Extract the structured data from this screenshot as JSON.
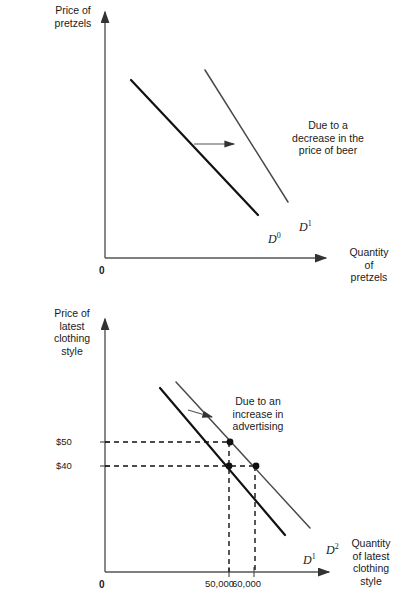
{
  "figures": [
    {
      "id": "demand-shift-pretzels",
      "y_axis_label": "Price of\npretzels",
      "x_axis_label": "Quantity\nof\npretzels",
      "origin_label": "0",
      "annotation": "Due to a\ndecrease in the\nprice of beer",
      "curves": [
        {
          "name": "D0",
          "label": "D",
          "superscript": "0"
        },
        {
          "name": "D1",
          "label": "D",
          "superscript": "1"
        }
      ],
      "shift_arrow": "rightward-shift-arrow",
      "chart_data": {
        "type": "line",
        "title": "",
        "xlabel": "Quantity of pretzels",
        "ylabel": "Price of pretzels",
        "grid": false,
        "legend": "none",
        "annotations": [
          "Due to a decrease in the price of beer"
        ],
        "series": [
          {
            "name": "D0",
            "points": [
              [
                131,
                80
              ],
              [
                258,
                215
              ]
            ]
          },
          {
            "name": "D1",
            "points": [
              [
                205,
                70
              ],
              [
                288,
                202
              ]
            ]
          }
        ],
        "axis_ranges": {
          "x": [
            105,
            332
          ],
          "y": [
            5,
            258
          ]
        }
      }
    },
    {
      "id": "demand-shift-clothing",
      "y_axis_label": "Price of\nlatest\nclothing\nstyle",
      "x_axis_label": "Quantity\nof latest\nclothing\nstyle",
      "origin_label": "0",
      "annotation": "Due to an\nincrease in\nadvertising",
      "price_ticks": [
        "$50",
        "$40"
      ],
      "quantity_ticks": [
        "50,000",
        "60,000"
      ],
      "curves": [
        {
          "name": "D1",
          "label": "D",
          "superscript": "1"
        },
        {
          "name": "D2",
          "label": "D",
          "superscript": "2"
        }
      ],
      "shift_arrow": "rightward-shift-arrow",
      "chart_data": {
        "type": "line",
        "title": "",
        "xlabel": "Quantity of latest clothing style",
        "ylabel": "Price of latest clothing style",
        "grid": false,
        "legend": "none",
        "annotations": [
          "Due to an increase in advertising"
        ],
        "price_axis_values": [
          50,
          40
        ],
        "quantity_axis_values": [
          50000,
          60000
        ],
        "series": [
          {
            "name": "D1",
            "points": [
              [
                160,
                388
              ],
              [
                285,
                535
              ]
            ]
          },
          {
            "name": "D2",
            "points": [
              [
                176,
                382
              ],
              [
                310,
                528
              ]
            ]
          }
        ],
        "equilibrium_points": [
          {
            "price": 50,
            "quantity": 50000,
            "curve": "D2"
          },
          {
            "price": 40,
            "quantity": 50000,
            "curve": "D1"
          },
          {
            "price": 40,
            "quantity": 60000,
            "curve": "D2"
          }
        ],
        "axis_ranges": {
          "x": [
            105,
            335
          ],
          "y": [
            312,
            572
          ]
        }
      }
    }
  ],
  "colors": {
    "ink": "#1a1a1a",
    "axis": "#555555",
    "curve_dark": "#111111",
    "curve_light": "#4a4a4a",
    "background": "#ffffff"
  }
}
